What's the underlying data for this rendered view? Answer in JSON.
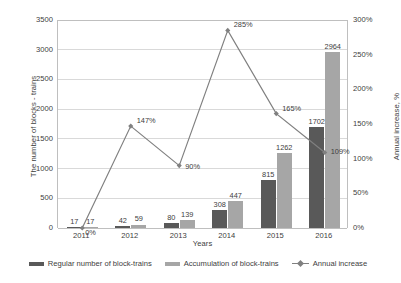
{
  "chart_data": {
    "type": "bar",
    "title": "",
    "categories": [
      "2011",
      "2012",
      "2013",
      "2014",
      "2015",
      "2016"
    ],
    "series": [
      {
        "name": "Regular number of block-trains",
        "type": "bar",
        "color": "#595959",
        "axis": "left",
        "values": [
          17,
          42,
          80,
          308,
          815,
          1702
        ],
        "labels": [
          "17",
          "42",
          "80",
          "308",
          "815",
          "1702"
        ]
      },
      {
        "name": "Accumulation of block-trains",
        "type": "bar",
        "color": "#a6a6a6",
        "axis": "left",
        "values": [
          17,
          59,
          139,
          447,
          1262,
          2964
        ],
        "labels": [
          "17",
          "59",
          "139",
          "447",
          "1262",
          "2964"
        ]
      },
      {
        "name": "Annual increase",
        "type": "line",
        "color": "#808080",
        "marker": "diamond",
        "axis": "right",
        "values": [
          0,
          147,
          90,
          285,
          165,
          109
        ],
        "labels": [
          "0%",
          "147%",
          "90%",
          "285%",
          "165%",
          "109%"
        ]
      }
    ],
    "xlabel": "Years",
    "ylabel": "The number of blocks - trains",
    "y2label": "Annual increase, %",
    "ylim": [
      0,
      3500
    ],
    "y2lim": [
      0,
      300
    ],
    "yticks": [
      "0",
      "500",
      "1000",
      "1500",
      "2000",
      "2500",
      "3000",
      "3500"
    ],
    "y2ticks": [
      "0%",
      "50%",
      "100%",
      "150%",
      "200%",
      "250%",
      "300%"
    ],
    "grid": true,
    "legend_position": "bottom"
  },
  "axes": {
    "y_left_title": "The number of blocks - trains",
    "y_right_title": "Annual increase, %",
    "x_title": "Years"
  },
  "legend": {
    "items": [
      {
        "label": "Regular number of block-trains"
      },
      {
        "label": "Accumulation of block-trains"
      },
      {
        "label": "Annual increase"
      }
    ]
  }
}
